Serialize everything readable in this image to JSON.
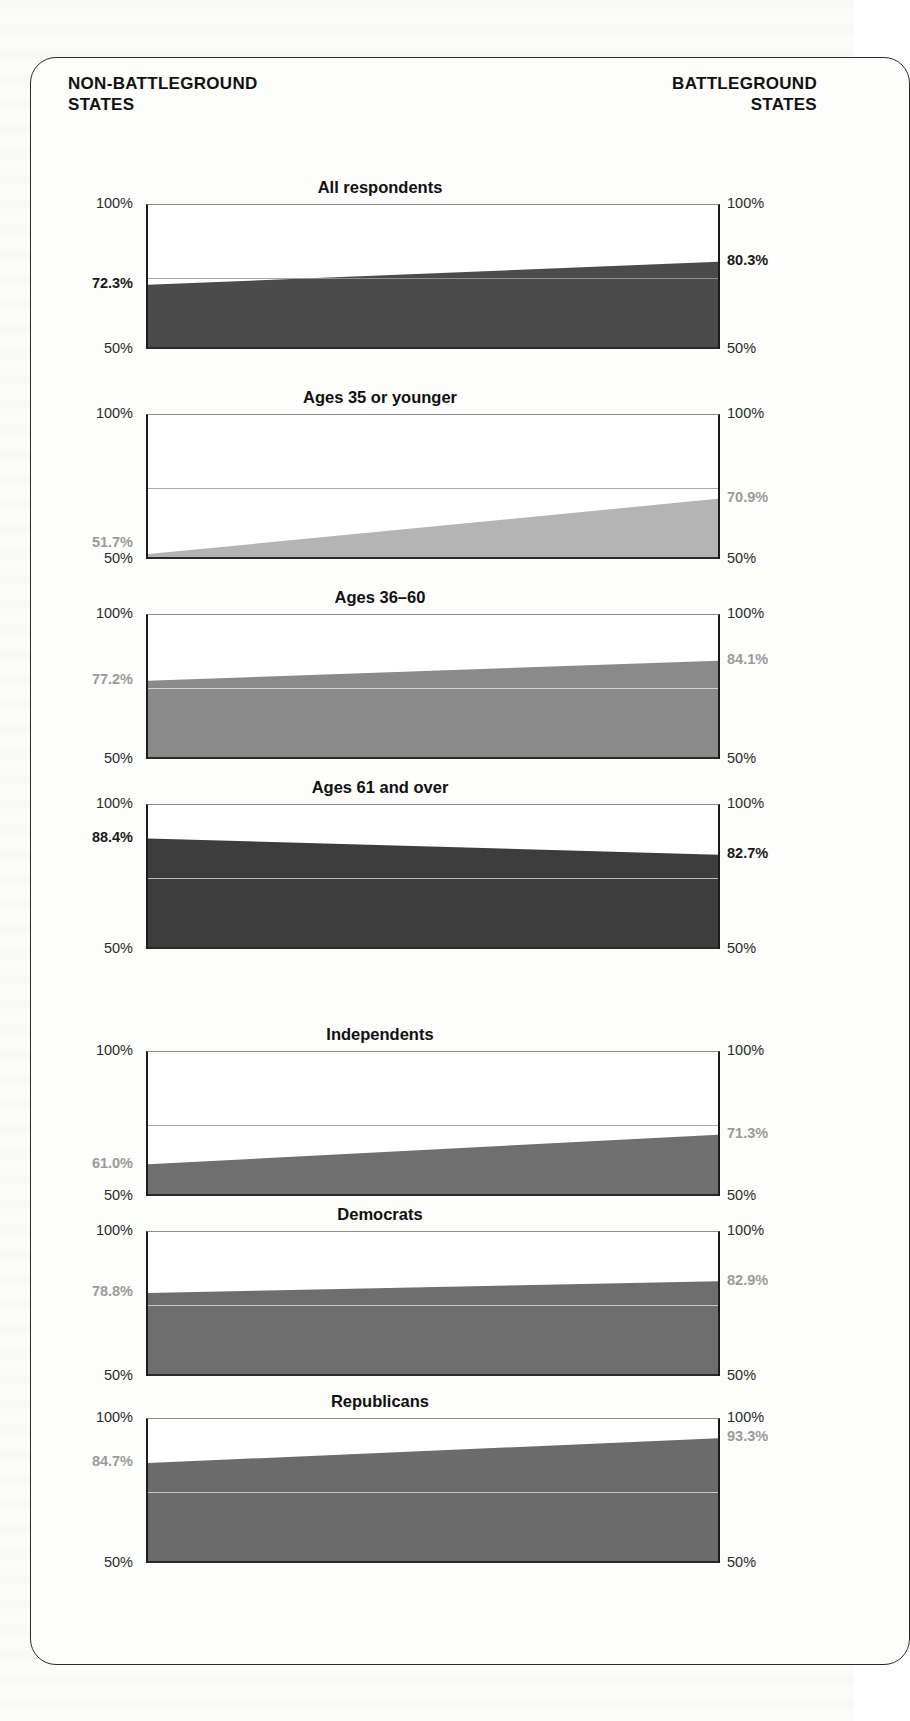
{
  "header": {
    "left_line1": "NON-BATTLEGROUND",
    "left_line2": "STATES",
    "right_line1": "BATTLEGROUND",
    "right_line2": "STATES"
  },
  "axis": {
    "top_tick": "100%",
    "bottom_tick": "50%"
  },
  "chart_data": {
    "type": "area",
    "title": "",
    "xlabel": "",
    "ylabel": "",
    "ylim": [
      50,
      100
    ],
    "grid": true,
    "gridlines": [
      75
    ],
    "x": [
      "Non-battleground states",
      "Battleground states"
    ],
    "legend": "none",
    "panels": [
      {
        "title": "All respondents",
        "left_value": 72.3,
        "right_value": 80.3,
        "left_label": "72.3%",
        "right_label": "80.3%",
        "left_tick_top": "100%",
        "left_tick_bottom": "50%",
        "right_tick_top": "100%",
        "right_tick_bottom": "50%",
        "fill_color": "#4b4b4b",
        "label_tone": "dark"
      },
      {
        "title": "Ages 35 or younger",
        "left_value": 51.7,
        "right_value": 70.9,
        "left_label": "51.7%",
        "right_label": "70.9%",
        "left_tick_top": "100%",
        "left_tick_bottom": "50%",
        "right_tick_top": "100%",
        "right_tick_bottom": "50%",
        "fill_color": "#b4b4b4",
        "label_tone": "light"
      },
      {
        "title": "Ages 36–60",
        "left_value": 77.2,
        "right_value": 84.1,
        "left_label": "77.2%",
        "right_label": "84.1%",
        "left_tick_top": "100%",
        "left_tick_bottom": "50%",
        "right_tick_top": "100%",
        "right_tick_bottom": "50%",
        "fill_color": "#8a8a8a",
        "label_tone": "light"
      },
      {
        "title": "Ages 61 and over",
        "left_value": 88.4,
        "right_value": 82.7,
        "left_label": "88.4%",
        "right_label": "82.7%",
        "left_tick_top": "100%",
        "left_tick_bottom": "50%",
        "right_tick_top": "100%",
        "right_tick_bottom": "50%",
        "fill_color": "#3d3d3d",
        "label_tone": "dark"
      },
      {
        "title": "Independents",
        "left_value": 61.0,
        "right_value": 71.3,
        "left_label": "61.0%",
        "right_label": "71.3%",
        "left_tick_top": "100%",
        "left_tick_bottom": "50%",
        "right_tick_top": "100%",
        "right_tick_bottom": "50%",
        "fill_color": "#6f6f6f",
        "label_tone": "light"
      },
      {
        "title": "Democrats",
        "left_value": 78.8,
        "right_value": 82.9,
        "left_label": "78.8%",
        "right_label": "82.9%",
        "left_tick_top": "100%",
        "left_tick_bottom": "50%",
        "right_tick_top": "100%",
        "right_tick_bottom": "50%",
        "fill_color": "#6e6e6e",
        "label_tone": "light"
      },
      {
        "title": "Republicans",
        "left_value": 84.7,
        "right_value": 93.3,
        "left_label": "84.7%",
        "right_label": "93.3%",
        "left_tick_top": "100%",
        "left_tick_bottom": "50%",
        "right_tick_top": "100%",
        "right_tick_bottom": "50%",
        "fill_color": "#6b6b6b",
        "label_tone": "light"
      }
    ]
  }
}
